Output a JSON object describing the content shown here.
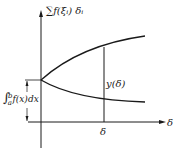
{
  "diagram": {
    "y_axis_label": "∑f(ξᵢ) δᵢ",
    "x_axis_label": "δ",
    "x_tick_label": "δ",
    "gap_label": "y(δ)",
    "integral_label": {
      "symbol": "∫",
      "upper": "b",
      "lower": "a",
      "integrand": "f(x)dx"
    },
    "colors": {
      "line": "#1a1a1a",
      "background": "#ffffff"
    },
    "curves": [
      {
        "name": "upper-sum-curve",
        "description": "increasing concave curve from integral value"
      },
      {
        "name": "lower-sum-curve",
        "description": "decreasing convex curve from integral value"
      }
    ]
  }
}
